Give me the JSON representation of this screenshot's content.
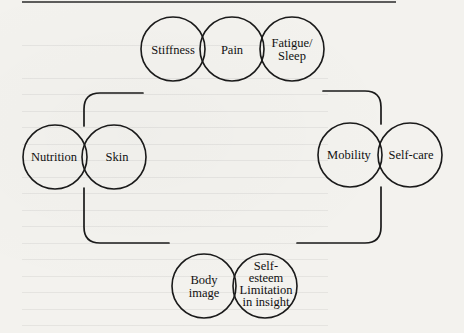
{
  "diagram": {
    "type": "venn-cluster-domains",
    "groups": [
      {
        "id": "top",
        "circles": [
          {
            "key": "stiffness",
            "label": "Stiffness",
            "cx": 173,
            "cy": 49,
            "r": 32
          },
          {
            "key": "pain",
            "label": "Pain",
            "cx": 232,
            "cy": 49,
            "r": 32
          },
          {
            "key": "fatigue",
            "label": "Fatigue/\nSleep",
            "cx": 292,
            "cy": 49,
            "r": 32
          }
        ]
      },
      {
        "id": "left",
        "circles": [
          {
            "key": "nutrition",
            "label": "Nutrition",
            "cx": 55,
            "cy": 157,
            "r": 32
          },
          {
            "key": "skin",
            "label": "Skin",
            "cx": 114,
            "cy": 157,
            "r": 32
          }
        ]
      },
      {
        "id": "right",
        "circles": [
          {
            "key": "mobility",
            "label": "Mobility",
            "cx": 350,
            "cy": 155,
            "r": 32
          },
          {
            "key": "selfcare",
            "label": "Self-care",
            "cx": 410,
            "cy": 155,
            "r": 32
          }
        ]
      },
      {
        "id": "bottom",
        "circles": [
          {
            "key": "bodyimage",
            "label": "Body\nimage",
            "cx": 204,
            "cy": 286,
            "r": 32
          },
          {
            "key": "selfesteem",
            "label": "Self-\nesteem\nLimitation\nin insight",
            "cx": 265,
            "cy": 286,
            "r": 32
          }
        ]
      }
    ],
    "labels": {
      "stiffness": "Stiffness",
      "pain": "Pain",
      "fatigue_line1": "Fatigue/",
      "fatigue_line2": "Sleep",
      "nutrition": "Nutrition",
      "skin": "Skin",
      "mobility": "Mobility",
      "selfcare": "Self-care",
      "bodyimage_line1": "Body",
      "bodyimage_line2": "image",
      "selfesteem_line1": "Self-",
      "selfesteem_line2": "esteem",
      "selfesteem_line3": "Limitation",
      "selfesteem_line4": "in insight"
    },
    "connector": "rounded rectangular frame broken into four corner brackets linking the four circle groups",
    "colors": {
      "stroke": "#1a1a1a",
      "paper": "#f3f2ee",
      "text": "#111111"
    }
  }
}
